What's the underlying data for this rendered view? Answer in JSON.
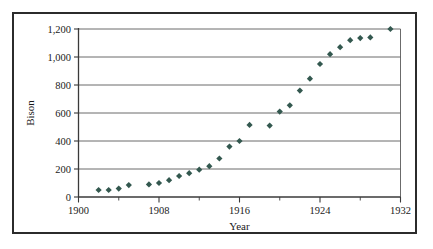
{
  "figure": {
    "background_color": "#ffffff",
    "frame_color": "#2b2b2b",
    "marker_color": "#33584f",
    "gridline_color": "#5a5a5a"
  },
  "chart_data": {
    "type": "scatter",
    "title": "",
    "xlabel": "Year",
    "ylabel": "Bison",
    "xlim": [
      1900,
      1932
    ],
    "ylim": [
      0,
      1200
    ],
    "xticks": [
      1900,
      1908,
      1916,
      1924,
      1932
    ],
    "xtick_labels": [
      "1900",
      "1908",
      "1916",
      "1924",
      "1932"
    ],
    "xminor_ticks": [
      1904,
      1912,
      1920,
      1928
    ],
    "yticks": [
      0,
      200,
      400,
      600,
      800,
      1000,
      1200
    ],
    "ytick_labels": [
      "0",
      "200",
      "400",
      "600",
      "800",
      "1,000",
      "1,200"
    ],
    "grid": "horizontal",
    "legend": "none",
    "marker": "diamond",
    "x": [
      1902,
      1903,
      1904,
      1905,
      1907,
      1908,
      1909,
      1910,
      1911,
      1912,
      1913,
      1914,
      1915,
      1916,
      1917,
      1919,
      1920,
      1921,
      1922,
      1923,
      1924,
      1925,
      1926,
      1927,
      1928,
      1929,
      1931
    ],
    "y": [
      50,
      50,
      60,
      85,
      90,
      100,
      120,
      150,
      170,
      195,
      220,
      275,
      360,
      400,
      515,
      510,
      610,
      655,
      760,
      845,
      950,
      1020,
      1070,
      1120,
      1135,
      1140,
      1200
    ],
    "series": [
      {
        "name": "Bison",
        "points": [
          [
            1902,
            50
          ],
          [
            1903,
            50
          ],
          [
            1904,
            60
          ],
          [
            1905,
            85
          ],
          [
            1907,
            90
          ],
          [
            1908,
            100
          ],
          [
            1909,
            120
          ],
          [
            1910,
            150
          ],
          [
            1911,
            170
          ],
          [
            1912,
            195
          ],
          [
            1913,
            220
          ],
          [
            1914,
            275
          ],
          [
            1915,
            360
          ],
          [
            1916,
            400
          ],
          [
            1917,
            515
          ],
          [
            1919,
            510
          ],
          [
            1920,
            610
          ],
          [
            1921,
            655
          ],
          [
            1922,
            760
          ],
          [
            1923,
            845
          ],
          [
            1924,
            950
          ],
          [
            1925,
            1020
          ],
          [
            1926,
            1070
          ],
          [
            1927,
            1120
          ],
          [
            1928,
            1135
          ],
          [
            1929,
            1140
          ],
          [
            1931,
            1200
          ]
        ]
      }
    ]
  }
}
